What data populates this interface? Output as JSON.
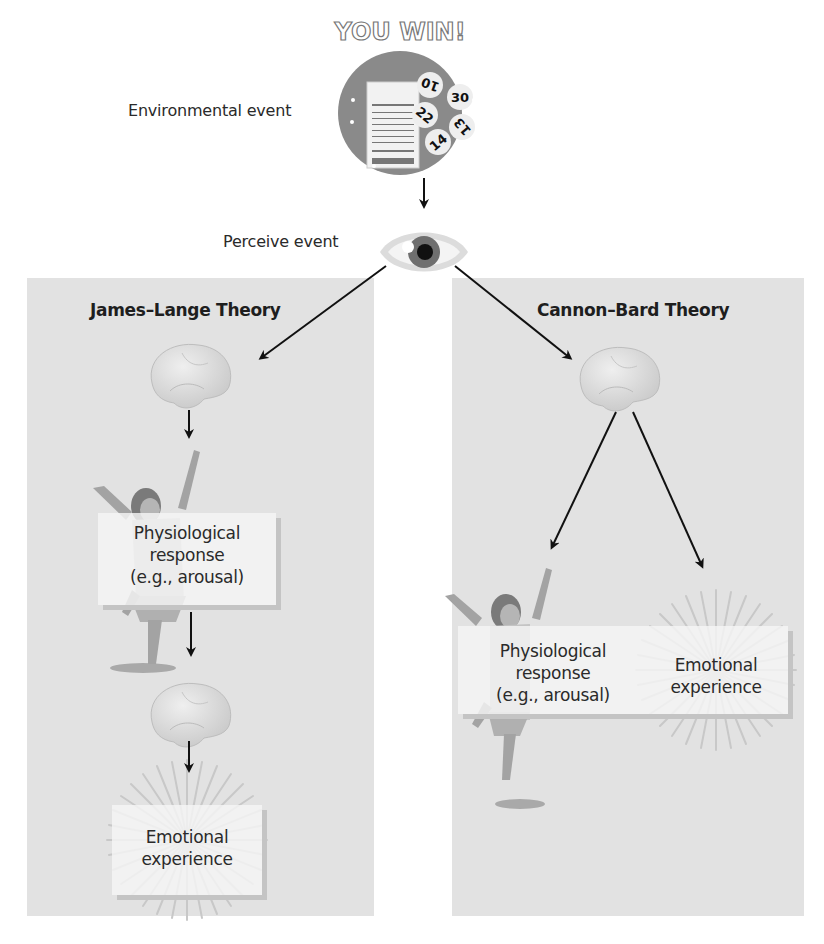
{
  "diagram": {
    "title_event": "Environmental event",
    "title_perceive": "Perceive event",
    "lottery": {
      "banner": "YOU WIN!",
      "balls": [
        "10",
        "30",
        "22",
        "13",
        "14"
      ],
      "ticket_header": "Lotto",
      "ticket_footer": "5 Plays"
    },
    "colors": {
      "panel": "#e2e2e2",
      "card": "#f3f3f3",
      "arrow": "#111111",
      "lottery_bg": "#8a8a8a",
      "eye_iris": "#6f6f6f",
      "brain": "#d4d4d4"
    }
  },
  "james_lange": {
    "title": "James–Lange Theory",
    "physiological": {
      "line1": "Physiological",
      "line2": "response",
      "line3": "(e.g., arousal)"
    },
    "emotional": {
      "line1": "Emotional",
      "line2": "experience"
    }
  },
  "cannon_bard": {
    "title": "Cannon–Bard Theory",
    "physiological": {
      "line1": "Physiological",
      "line2": "response",
      "line3": "(e.g., arousal)"
    },
    "emotional": {
      "line1": "Emotional",
      "line2": "experience"
    }
  }
}
